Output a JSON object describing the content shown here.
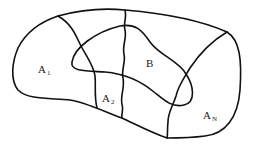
{
  "diagram": {
    "type": "set-partition venn diagram",
    "colors": {
      "stroke": "#111111",
      "text": "#222222",
      "background": "#ffffff"
    },
    "regions": [
      {
        "id": "A1",
        "main": "A",
        "sub": "1"
      },
      {
        "id": "A2",
        "main": "A",
        "sub": "2"
      },
      {
        "id": "AN",
        "main": "A",
        "sub": "N"
      }
    ],
    "event": {
      "id": "B",
      "main": "B"
    }
  }
}
